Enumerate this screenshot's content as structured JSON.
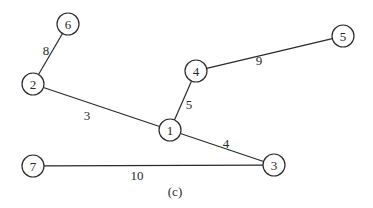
{
  "diagram": {
    "caption": "(c)",
    "node_radius": 11,
    "nodes": [
      {
        "id": "6",
        "label": "6",
        "x": 68,
        "y": 24
      },
      {
        "id": "2",
        "label": "2",
        "x": 33,
        "y": 84
      },
      {
        "id": "4",
        "label": "4",
        "x": 196,
        "y": 71
      },
      {
        "id": "5",
        "label": "5",
        "x": 343,
        "y": 36
      },
      {
        "id": "1",
        "label": "1",
        "x": 170,
        "y": 130
      },
      {
        "id": "3",
        "label": "3",
        "x": 274,
        "y": 165
      },
      {
        "id": "7",
        "label": "7",
        "x": 33,
        "y": 166
      }
    ],
    "edges": [
      {
        "from": "6",
        "to": "2",
        "weight": "8",
        "lx": 46,
        "ly": 50
      },
      {
        "from": "2",
        "to": "1",
        "weight": "3",
        "lx": 87,
        "ly": 115
      },
      {
        "from": "1",
        "to": "4",
        "weight": "5",
        "lx": 189,
        "ly": 104
      },
      {
        "from": "4",
        "to": "5",
        "weight": "9",
        "lx": 259,
        "ly": 60
      },
      {
        "from": "1",
        "to": "3",
        "weight": "4",
        "lx": 226,
        "ly": 143
      },
      {
        "from": "7",
        "to": "3",
        "weight": "10",
        "lx": 137,
        "ly": 175
      }
    ]
  }
}
